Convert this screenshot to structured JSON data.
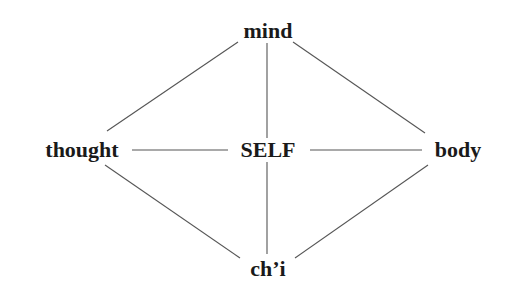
{
  "diagram": {
    "type": "network",
    "nodes": {
      "top": {
        "id": "mind",
        "label": "mind",
        "x": 268,
        "y": 38
      },
      "left": {
        "id": "thought",
        "label": "thought",
        "x": 82,
        "y": 157
      },
      "center": {
        "id": "self",
        "label": "SELF",
        "x": 268,
        "y": 157
      },
      "right": {
        "id": "body",
        "label": "body",
        "x": 458,
        "y": 157
      },
      "bottom": {
        "id": "chi",
        "label": "ch’i",
        "x": 268,
        "y": 276
      }
    },
    "edges": [
      {
        "from": "mind",
        "to": "thought"
      },
      {
        "from": "mind",
        "to": "self"
      },
      {
        "from": "mind",
        "to": "body"
      },
      {
        "from": "thought",
        "to": "self"
      },
      {
        "from": "self",
        "to": "body"
      },
      {
        "from": "thought",
        "to": "chi"
      },
      {
        "from": "self",
        "to": "chi"
      },
      {
        "from": "body",
        "to": "chi"
      }
    ],
    "colors": {
      "text": "#1a1a1a",
      "line": "#555555",
      "background": "#ffffff"
    }
  }
}
